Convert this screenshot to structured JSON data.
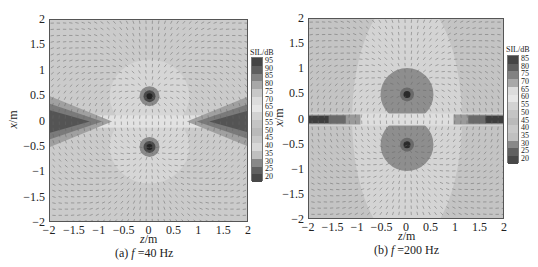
{
  "figure": {
    "panels": [
      {
        "id": "a",
        "caption_prefix": "(a) ",
        "caption_var": "f",
        "caption_rest": " =40 Hz",
        "xlabel_var": "z",
        "xlabel_unit": "/m",
        "ylabel_var": "x",
        "ylabel_unit": "/m",
        "colorbar_title": "SIL/dB",
        "colorbar_levels": [
          "95",
          "90",
          "85",
          "80",
          "75",
          "70",
          "65",
          "60",
          "55",
          "50",
          "45",
          "40",
          "35",
          "30",
          "25",
          "20"
        ]
      },
      {
        "id": "b",
        "caption_prefix": "(b) ",
        "caption_var": "f",
        "caption_rest": " =200 Hz",
        "xlabel_var": "z",
        "xlabel_unit": "/m",
        "ylabel_var": "x",
        "ylabel_unit": "/m",
        "colorbar_title": "SIL/dB",
        "colorbar_levels": [
          "85",
          "80",
          "75",
          "70",
          "65",
          "60",
          "55",
          "50",
          "45",
          "40",
          "35",
          "30",
          "25",
          "20"
        ]
      }
    ],
    "xticks": [
      "−2",
      "−1.5",
      "−1",
      "−0.5",
      "0",
      "0.5",
      "1",
      "1.5",
      "2"
    ],
    "yticks": [
      "2",
      "1.5",
      "1",
      "0.5",
      "0",
      "−0.5",
      "−1",
      "−1.5",
      "−2"
    ]
  },
  "chart_data": [
    {
      "type": "heatmap",
      "title": "(a) f =40 Hz",
      "xlabel": "z/m",
      "ylabel": "x/m",
      "xlim": [
        -2,
        2
      ],
      "ylim": [
        -2,
        2
      ],
      "xticks": [
        -2,
        -1.5,
        -1,
        -0.5,
        0,
        0.5,
        1,
        1.5,
        2
      ],
      "yticks": [
        -2,
        -1.5,
        -1,
        -0.5,
        0,
        0.5,
        1,
        1.5,
        2
      ],
      "colorbar": {
        "title": "SIL/dB",
        "min": 20,
        "max": 95,
        "step": 5,
        "position": "right"
      },
      "overlay": "sound intensity vector arrows",
      "features": [
        {
          "kind": "source",
          "z": 0,
          "x": 0.5,
          "level_dB": 95
        },
        {
          "kind": "source",
          "z": 0,
          "x": -0.5,
          "level_dB": 95
        },
        {
          "kind": "low-level wedge",
          "z_range": [
            -2,
            -0.8
          ],
          "x_center": 0,
          "level_dB": 20
        },
        {
          "kind": "low-level wedge",
          "z_range": [
            0.8,
            2
          ],
          "x_center": 0,
          "level_dB": 20
        }
      ],
      "grid": false
    },
    {
      "type": "heatmap",
      "title": "(b) f =200 Hz",
      "xlabel": "z/m",
      "ylabel": "x/m",
      "xlim": [
        -2,
        2
      ],
      "ylim": [
        -2,
        2
      ],
      "xticks": [
        -2,
        -1.5,
        -1,
        -0.5,
        0,
        0.5,
        1,
        1.5,
        2
      ],
      "yticks": [
        -2,
        -1.5,
        -1,
        -0.5,
        0,
        0.5,
        1,
        1.5,
        2
      ],
      "colorbar": {
        "title": "SIL/dB",
        "min": 20,
        "max": 85,
        "step": 5,
        "position": "right"
      },
      "overlay": "sound intensity vector arrows",
      "features": [
        {
          "kind": "source",
          "z": 0,
          "x": 0.5,
          "level_dB": 85,
          "surrounding_disc_radius_m": 0.5
        },
        {
          "kind": "source",
          "z": 0,
          "x": -0.5,
          "level_dB": 85,
          "surrounding_disc_radius_m": 0.5
        },
        {
          "kind": "low-level strip",
          "z_range": [
            -2,
            -1.2
          ],
          "x_center": 0,
          "level_dB": 20
        },
        {
          "kind": "low-level strip",
          "z_range": [
            1.2,
            2
          ],
          "x_center": 0,
          "level_dB": 20
        }
      ],
      "grid": false
    }
  ]
}
